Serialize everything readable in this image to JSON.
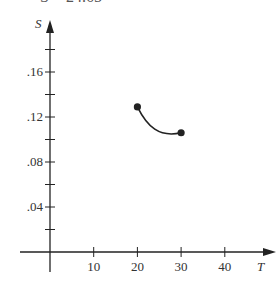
{
  "header_fragment": "S = 24.65",
  "chart_data": {
    "type": "line",
    "title": "",
    "xlabel": "T",
    "ylabel": "S",
    "x_ticks": [
      10,
      20,
      30,
      40
    ],
    "x_tick_labels": [
      "10",
      "20",
      "30",
      "40"
    ],
    "y_ticks": [
      0.04,
      0.08,
      0.12,
      0.16
    ],
    "y_tick_labels": [
      ".04",
      ".08",
      ".12",
      ".16"
    ],
    "y_minor_ticks": [
      0.02,
      0.06,
      0.1,
      0.14,
      0.18
    ],
    "xlim": [
      -7,
      46
    ],
    "ylim": [
      0,
      0.2
    ],
    "series": [
      {
        "name": "S(T)",
        "curve": [
          [
            20,
            0.129
          ],
          [
            22,
            0.121
          ],
          [
            24,
            0.114
          ],
          [
            26,
            0.109
          ],
          [
            28,
            0.106
          ],
          [
            30,
            0.106
          ]
        ],
        "endpoints": [
          [
            20,
            0.129
          ],
          [
            30,
            0.106
          ]
        ]
      }
    ],
    "grid": false,
    "legend": null
  }
}
